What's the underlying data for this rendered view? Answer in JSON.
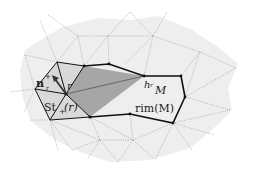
{
  "figure": {
    "labels": {
      "normal": "n",
      "normal_sub": "r",
      "normal_sup": "+",
      "vertex": "r",
      "star": "St",
      "star_sub": "+",
      "star_arg": "(r)",
      "height": "h",
      "height_sub": "r",
      "manifold": "M",
      "rim": "rim(M)"
    },
    "colors": {
      "background_surface": "#eeeeee",
      "mesh_dotted": "#9a9a9a",
      "star_fill": "#d9d9d9",
      "cone_fill": "#a6a6a6",
      "edge": "#111111"
    }
  }
}
